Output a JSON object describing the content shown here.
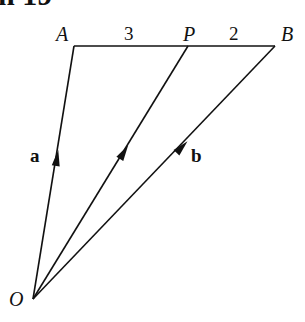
{
  "header_fragment": "n 19",
  "diagram": {
    "points": {
      "O": {
        "label": "O",
        "x": 33,
        "y": 299
      },
      "A": {
        "label": "A",
        "x": 74,
        "y": 46
      },
      "P": {
        "label": "P",
        "x": 188,
        "y": 46
      },
      "B": {
        "label": "B",
        "x": 275,
        "y": 46
      }
    },
    "segment_labels": {
      "AP": "3",
      "PB": "2"
    },
    "vector_labels": {
      "OA": "a",
      "OB": "b"
    },
    "stroke_color": "#111111",
    "background": "#ffffff"
  }
}
